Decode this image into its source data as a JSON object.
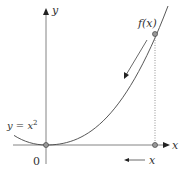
{
  "diagram": {
    "axes": {
      "x_label": "x",
      "y_label": "y",
      "origin_label": "0"
    },
    "curve": {
      "equation_label": "y = x",
      "equation_exponent": "2",
      "function_label": "f(x)"
    },
    "arrow_label": "x",
    "colors": {
      "axis": "#555555",
      "curve": "#444444",
      "point_fill": "#999999",
      "text": "#333333"
    }
  }
}
